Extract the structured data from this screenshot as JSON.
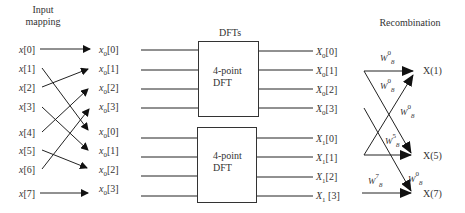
{
  "headers": {
    "input_mapping_line1": "Input",
    "input_mapping_line2": "mapping",
    "dfts": "DFTs",
    "recombination": "Recombination"
  },
  "inputs": [
    {
      "base": "x",
      "index": "[0]"
    },
    {
      "base": "x",
      "index": "[1]"
    },
    {
      "base": "x",
      "index": "[2]"
    },
    {
      "base": "x",
      "index": "[3]"
    },
    {
      "base": "x",
      "index": "[4]"
    },
    {
      "base": "x",
      "index": "[5]"
    },
    {
      "base": "x",
      "index": "[6]"
    },
    {
      "base": "x",
      "index": "[7]"
    }
  ],
  "mapped": [
    {
      "base": "x",
      "sub": "0",
      "index": "[0]"
    },
    {
      "base": "x",
      "sub": "0",
      "index": "[1]"
    },
    {
      "base": "x",
      "sub": "0",
      "index": "[2]"
    },
    {
      "base": "x",
      "sub": "0",
      "index": "[3]"
    },
    {
      "base": "x",
      "sub": "0",
      "index": "[0]"
    },
    {
      "base": "x",
      "sub": "0",
      "index": "[1]"
    },
    {
      "base": "x",
      "sub": "0",
      "index": "[2]"
    },
    {
      "base": "x",
      "sub": "0",
      "index": "[3]"
    }
  ],
  "dft_blocks": [
    {
      "line1": "4-point",
      "line2": "DFT"
    },
    {
      "line1": "4-point",
      "line2": "DFT"
    }
  ],
  "dft_outputs": [
    {
      "base": "X",
      "sub": "0",
      "index": "[0]"
    },
    {
      "base": "X",
      "sub": "0",
      "index": "[1]"
    },
    {
      "base": "X",
      "sub": "0",
      "index": "[2]"
    },
    {
      "base": "X",
      "sub": "0",
      "index": "[3]"
    },
    {
      "base": "X",
      "sub": "1",
      "index": "[0]"
    },
    {
      "base": "X",
      "sub": "1",
      "index": "[1]"
    },
    {
      "base": "X",
      "sub": "1",
      "index": "[2]"
    },
    {
      "base": "X",
      "sub": "1",
      "index": " [3]"
    }
  ],
  "twiddles": [
    {
      "base": "W",
      "sup": "0",
      "sub": "8"
    },
    {
      "base": "W",
      "sup": "0",
      "sub": "8"
    },
    {
      "base": "W",
      "sup": "0",
      "sub": "8"
    },
    {
      "base": "W",
      "sup": "5",
      "sub": "8"
    },
    {
      "base": "W",
      "sup": "7",
      "sub": "8"
    },
    {
      "base": "W",
      "sup": "0",
      "sub": "8"
    }
  ],
  "results": [
    "X(1)",
    "X(5)",
    "X(7)"
  ]
}
